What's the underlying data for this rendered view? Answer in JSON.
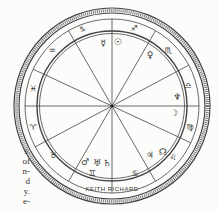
{
  "chart": {
    "title": "KEITH RICHARD",
    "center": [
      112,
      106
    ],
    "colors": {
      "ink": "#3a3a3a",
      "paper": "#fcfcfa"
    },
    "spoke_angles_deg": [
      0,
      28,
      60,
      90,
      120,
      155
    ],
    "zodiac_signs": [
      {
        "name": "capricorn",
        "glyph": "♑",
        "x": 82,
        "y": 29
      },
      {
        "name": "sagittarius",
        "glyph": "♐",
        "x": 134,
        "y": 28
      },
      {
        "name": "scorpio",
        "glyph": "♏",
        "x": 168,
        "y": 50
      },
      {
        "name": "libra",
        "glyph": "♎",
        "x": 188,
        "y": 85
      },
      {
        "name": "virgo",
        "glyph": "♍",
        "x": 190,
        "y": 127
      },
      {
        "name": "leo",
        "glyph": "♌",
        "x": 173,
        "y": 157
      },
      {
        "name": "cancer",
        "glyph": "♋",
        "x": 135,
        "y": 173
      },
      {
        "name": "gemini",
        "glyph": "♊",
        "x": 92,
        "y": 173
      },
      {
        "name": "taurus",
        "glyph": "♉",
        "x": 53,
        "y": 155
      },
      {
        "name": "aries",
        "glyph": "♈",
        "x": 33,
        "y": 127
      },
      {
        "name": "pisces",
        "glyph": "♓",
        "x": 33,
        "y": 88
      },
      {
        "name": "aquarius",
        "glyph": "♒",
        "x": 52,
        "y": 50
      }
    ],
    "planets": [
      {
        "name": "mercury",
        "glyph": "☿",
        "x": 103,
        "y": 43
      },
      {
        "name": "sun",
        "glyph": "☉",
        "x": 118,
        "y": 42
      },
      {
        "name": "venus",
        "glyph": "♀",
        "x": 150,
        "y": 55
      },
      {
        "name": "neptune",
        "glyph": "♆",
        "x": 177,
        "y": 97
      },
      {
        "name": "moon",
        "glyph": "☽",
        "x": 174,
        "y": 113
      },
      {
        "name": "node",
        "glyph": "☊",
        "x": 163,
        "y": 152
      },
      {
        "name": "jupiter",
        "glyph": "♃",
        "x": 150,
        "y": 155
      },
      {
        "name": "mars",
        "glyph": "♂",
        "x": 85,
        "y": 162
      },
      {
        "name": "uranus",
        "glyph": "♅",
        "x": 97,
        "y": 163
      },
      {
        "name": "saturn",
        "glyph": "♄",
        "x": 107,
        "y": 163
      }
    ]
  },
  "margin_text": [
    "s.",
    "of",
    "n-",
    "d",
    "y.",
    "e-"
  ]
}
